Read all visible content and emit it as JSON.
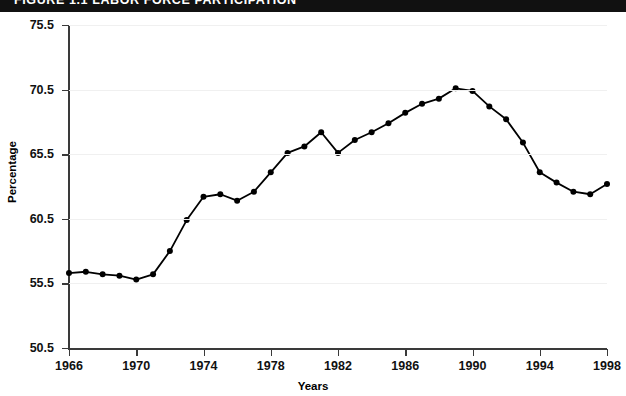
{
  "banner": {
    "text": "FIGURE 1.1   LABOR FORCE PARTICIPATION"
  },
  "axis": {
    "y_title": "Percentage",
    "x_title": "Years",
    "y_ticks": [
      "50.5",
      "55.5",
      "60.5",
      "65.5",
      "70.5",
      "75.5"
    ],
    "x_ticks": [
      "1966",
      "1970",
      "1974",
      "1978",
      "1982",
      "1986",
      "1990",
      "1994",
      "1998"
    ]
  },
  "colors": {
    "line": "#000000",
    "marker": "#000000",
    "axis": "#3a3a3a",
    "grid": "#f0f0f0",
    "banner": "#111111"
  },
  "chart_data": {
    "type": "line",
    "title": "FIGURE 1.1   LABOR FORCE PARTICIPATION",
    "xlabel": "Years",
    "ylabel": "Percentage",
    "xlim": [
      1966,
      1998
    ],
    "ylim": [
      50.5,
      75.5
    ],
    "ytick_values": [
      50.5,
      55.5,
      60.5,
      65.5,
      70.5,
      75.5
    ],
    "xtick_values": [
      1966,
      1970,
      1974,
      1978,
      1982,
      1986,
      1990,
      1994,
      1998
    ],
    "grid": true,
    "legend": "none",
    "markers": "filled-circle",
    "x": [
      1966,
      1967,
      1968,
      1969,
      1970,
      1971,
      1972,
      1973,
      1974,
      1975,
      1976,
      1977,
      1978,
      1979,
      1980,
      1981,
      1982,
      1983,
      1984,
      1985,
      1986,
      1987,
      1988,
      1989,
      1990,
      1991,
      1992,
      1993,
      1994,
      1995,
      1996,
      1997,
      1998
    ],
    "series": [
      {
        "name": "Labor force participation rate",
        "values": [
          56.3,
          56.4,
          56.2,
          56.1,
          55.8,
          56.2,
          58.0,
          60.4,
          62.2,
          62.4,
          61.9,
          62.6,
          64.1,
          65.6,
          66.1,
          67.2,
          65.6,
          66.6,
          67.2,
          67.9,
          68.7,
          69.4,
          69.8,
          70.6,
          70.4,
          69.2,
          68.2,
          66.4,
          64.1,
          63.3,
          62.6,
          62.4,
          63.2
        ]
      }
    ]
  }
}
